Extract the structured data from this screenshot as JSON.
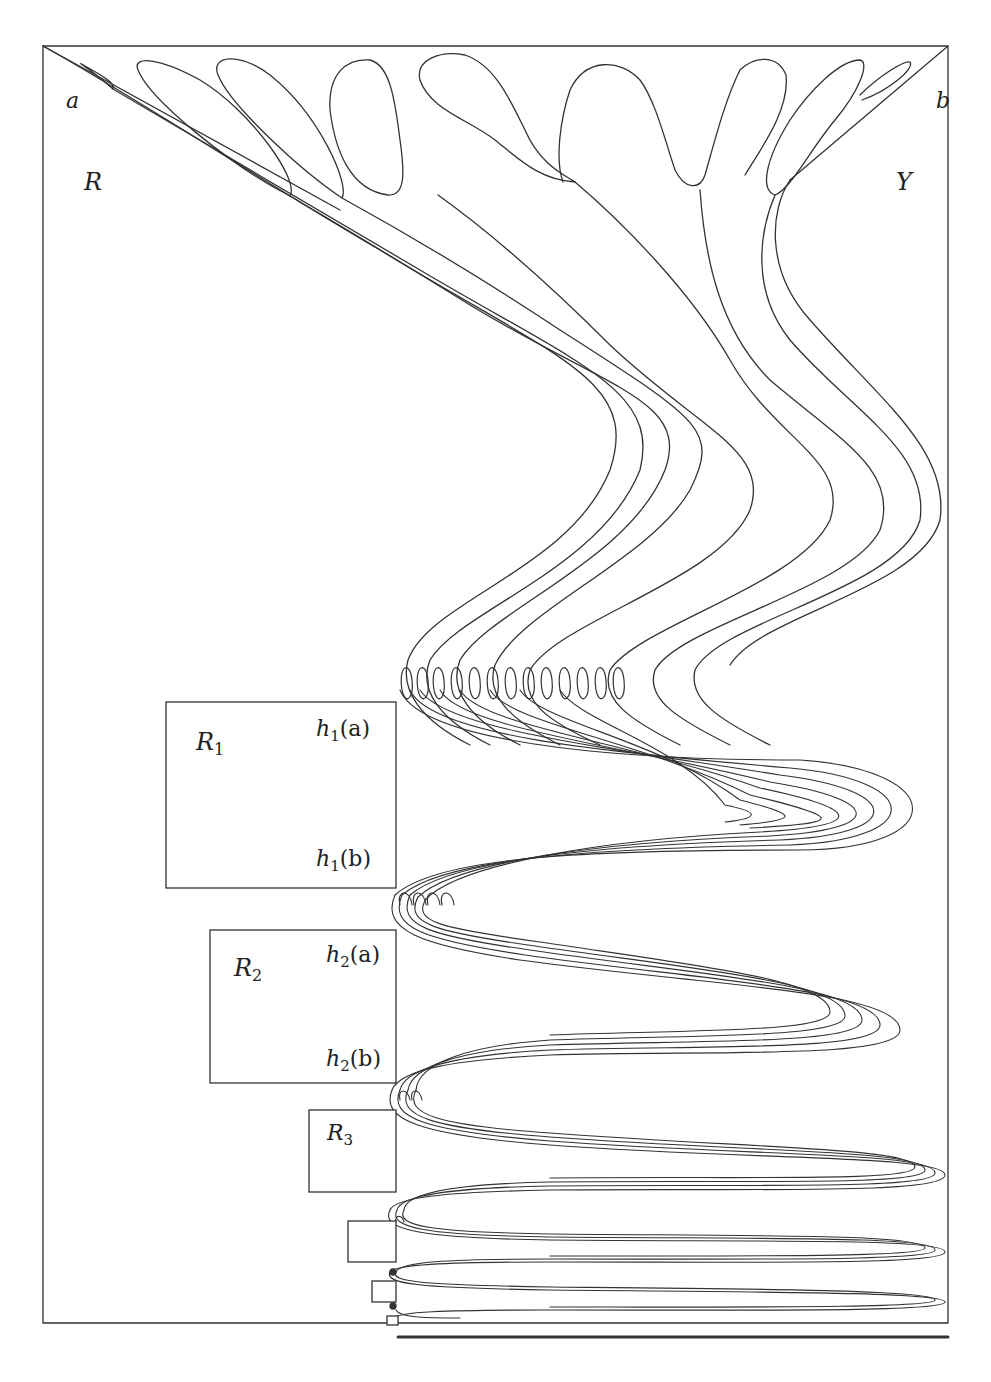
{
  "figure": {
    "stroke_color": "#333333",
    "frame": {
      "x": 43,
      "y": 46,
      "w": 905,
      "h": 1277
    },
    "corner_labels": {
      "a": {
        "text": "a",
        "x": 66,
        "y": 108
      },
      "b": {
        "text": "b",
        "x": 936,
        "y": 108
      }
    },
    "region_labels": {
      "R": {
        "text": "R",
        "x": 84,
        "y": 190
      },
      "Y": {
        "text": "Y",
        "x": 896,
        "y": 190
      }
    },
    "boxes": [
      {
        "id": "R1",
        "x": 166,
        "y": 702,
        "w": 230,
        "h": 186,
        "label": "R",
        "sub": "1",
        "label_x": 196,
        "label_y": 750,
        "ha": {
          "text": "h",
          "sub": "1",
          "arg": "(a)",
          "x": 316,
          "y": 736
        },
        "hb": {
          "text": "h",
          "sub": "1",
          "arg": "(b)",
          "x": 316,
          "y": 866
        }
      },
      {
        "id": "R2",
        "x": 210,
        "y": 930,
        "w": 186,
        "h": 153,
        "label": "R",
        "sub": "2",
        "label_x": 234,
        "label_y": 976,
        "ha": {
          "text": "h",
          "sub": "2",
          "arg": "(a)",
          "x": 326,
          "y": 962
        },
        "hb": {
          "text": "h",
          "sub": "2",
          "arg": "(b)",
          "x": 326,
          "y": 1066
        }
      },
      {
        "id": "R3",
        "x": 309,
        "y": 1110,
        "w": 87,
        "h": 82,
        "label": "R",
        "sub": "3",
        "label_x": 327,
        "label_y": 1140
      },
      {
        "id": "R4",
        "x": 348,
        "y": 1221,
        "w": 48,
        "h": 41
      },
      {
        "id": "R5",
        "x": 372,
        "y": 1281,
        "w": 24,
        "h": 21
      },
      {
        "id": "R6",
        "x": 387,
        "y": 1316,
        "w": 11,
        "h": 9
      }
    ],
    "fold_column_x": 396,
    "bottom_line": {
      "x1": 398,
      "x2": 948,
      "y": 1337
    }
  }
}
